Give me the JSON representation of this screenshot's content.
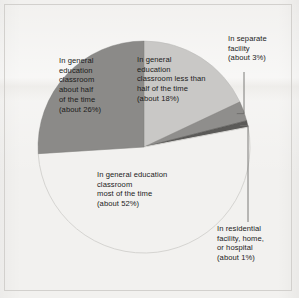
{
  "figure": {
    "background_color": "#f2f1ef",
    "frame_color": "#d2d0cd"
  },
  "chart_data": {
    "type": "pie",
    "title": "",
    "subtitle": "",
    "xlabel": "",
    "ylabel": "",
    "grid": false,
    "legend_position": "none",
    "label_format": "{category}\n(about {value}%)",
    "start_angle_deg": 0,
    "direction": "clockwise",
    "units": "percent",
    "total": 100,
    "categories": [
      "In general education classroom less than half of the time",
      "In separate facility",
      "In residential facility, home, or hospital",
      "In general education classroom most of the time",
      "In general education classroom about half of the time"
    ],
    "values": [
      18,
      3,
      1,
      52,
      26
    ],
    "colors": [
      "#c9c8c6",
      "#8f8e8c",
      "#5b5a58",
      "#f2f1ef",
      "#8b8a88"
    ],
    "slices": [
      {
        "id": "less-than-half",
        "category": "In general education classroom less than half of the time",
        "value": 18,
        "value_text": "(about 18%)",
        "color": "#c9c8c6",
        "label_placement": "inside",
        "label_text": "In general\neducation\nclassroom less than\nhalf of the time\n(about 18%)"
      },
      {
        "id": "separate-facility",
        "category": "In separate facility",
        "value": 3,
        "value_text": "(about 3%)",
        "color": "#8f8e8c",
        "label_placement": "callout",
        "label_text": "In separate\nfacility\n(about 3%)"
      },
      {
        "id": "residential-facility",
        "category": "In residential facility, home, or hospital",
        "value": 1,
        "value_text": "(about 1%)",
        "color": "#5b5a58",
        "label_placement": "callout",
        "label_text": "In residential\nfacility, home,\nor hospital\n(about 1%)"
      },
      {
        "id": "most-of-the-time",
        "category": "In general education classroom most of the time",
        "value": 52,
        "value_text": "(about 52%)",
        "color": "#f2f1ef",
        "label_placement": "inside",
        "label_text": "In general education\nclassroom\nmost of the time\n(about 52%)"
      },
      {
        "id": "about-half",
        "category": "In general education classroom about half of the time",
        "value": 26,
        "value_text": "(about 26%)",
        "color": "#8b8a88",
        "label_placement": "inside",
        "label_text": "In general\neducation\nclassroom\nabout half\nof the time\n(about 26%)"
      }
    ]
  },
  "callouts": {
    "separate_facility_leader": "elbow-line",
    "residential_leader": "elbow-line",
    "leader_color": "#6e6d6b"
  }
}
